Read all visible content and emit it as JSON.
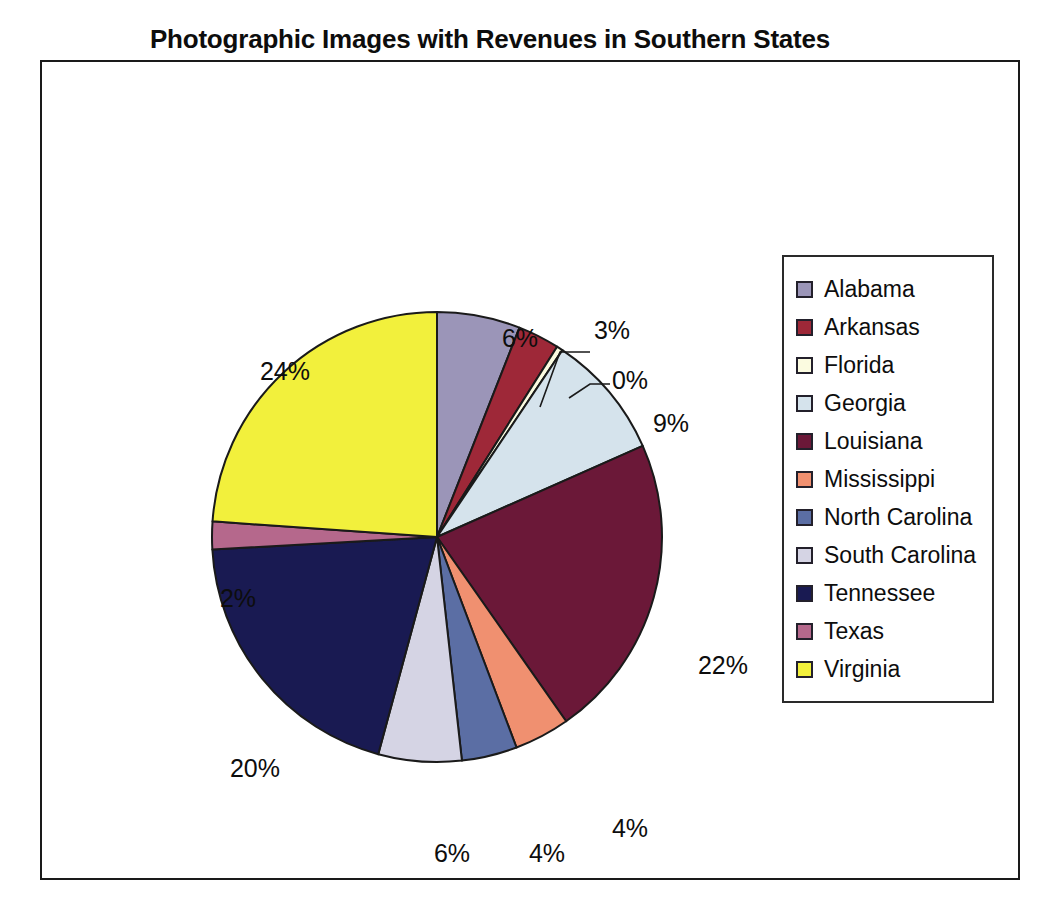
{
  "chart_title": "Photographic Images with Revenues in Southern States",
  "frame": {
    "border_color": "#1a1a1a",
    "background": "#ffffff"
  },
  "legend": {
    "position": "right",
    "border_color": "#2a2a2a",
    "background": "#ffffff"
  },
  "chart_data": {
    "type": "pie",
    "title": "Photographic Images with Revenues in Southern States",
    "xlabel": "",
    "ylabel": "",
    "grid": false,
    "legend_position": "right",
    "units": "percent",
    "start_angle_deg": 0,
    "direction": "clockwise",
    "categories": [
      "Alabama",
      "Arkansas",
      "Florida",
      "Georgia",
      "Louisiana",
      "Mississippi",
      "North Carolina",
      "South Carolina",
      "Tennessee",
      "Texas",
      "Virginia"
    ],
    "values": [
      6,
      3,
      0,
      9,
      22,
      4,
      4,
      6,
      20,
      2,
      24
    ],
    "data_labels": [
      "6%",
      "3%",
      "0%",
      "9%",
      "22%",
      "4%",
      "4%",
      "6%",
      "20%",
      "2%",
      "24%"
    ],
    "colors": [
      "#9b95b8",
      "#9e2838",
      "#fbfbe0",
      "#d5e3ec",
      "#6b1838",
      "#f09070",
      "#5b6ea4",
      "#d5d4e4",
      "#191a52",
      "#b5688c",
      "#f2f03c"
    ],
    "slice_border_color": "#1a1a1a",
    "series": [
      {
        "name": "Revenues",
        "values": [
          6,
          3,
          0,
          9,
          22,
          4,
          4,
          6,
          20,
          2,
          24
        ]
      }
    ]
  },
  "slices": [
    {
      "name": "Alabama",
      "label": "6%",
      "value": 6,
      "color": "#9b95b8",
      "leader": false
    },
    {
      "name": "Arkansas",
      "label": "3%",
      "value": 3,
      "color": "#9e2838",
      "leader": true
    },
    {
      "name": "Florida",
      "label": "0%",
      "value": 0,
      "color": "#fbfbe0",
      "leader": true
    },
    {
      "name": "Georgia",
      "label": "9%",
      "value": 9,
      "color": "#d5e3ec",
      "leader": false
    },
    {
      "name": "Louisiana",
      "label": "22%",
      "value": 22,
      "color": "#6b1838",
      "leader": false
    },
    {
      "name": "Mississippi",
      "label": "4%",
      "value": 4,
      "color": "#f09070",
      "leader": false
    },
    {
      "name": "North Carolina",
      "label": "4%",
      "value": 4,
      "color": "#5b6ea4",
      "leader": false
    },
    {
      "name": "South Carolina",
      "label": "6%",
      "value": 6,
      "color": "#d5d4e4",
      "leader": false
    },
    {
      "name": "Tennessee",
      "label": "20%",
      "value": 20,
      "color": "#191a52",
      "leader": false
    },
    {
      "name": "Texas",
      "label": "2%",
      "value": 2,
      "color": "#b5688c",
      "leader": false
    },
    {
      "name": "Virginia",
      "label": "24%",
      "value": 24,
      "color": "#f2f03c",
      "leader": false
    }
  ],
  "label_positions": [
    {
      "label": "6%",
      "x": 478,
      "y": 285
    },
    {
      "label": "3%",
      "x": 570,
      "y": 277
    },
    {
      "label": "0%",
      "x": 588,
      "y": 327
    },
    {
      "label": "9%",
      "x": 629,
      "y": 370
    },
    {
      "label": "22%",
      "x": 681,
      "y": 612
    },
    {
      "label": "4%",
      "x": 588,
      "y": 775
    },
    {
      "label": "4%",
      "x": 505,
      "y": 800
    },
    {
      "label": "6%",
      "x": 410,
      "y": 800
    },
    {
      "label": "20%",
      "x": 213,
      "y": 715
    },
    {
      "label": "2%",
      "x": 196,
      "y": 545
    },
    {
      "label": "24%",
      "x": 243,
      "y": 318
    }
  ]
}
